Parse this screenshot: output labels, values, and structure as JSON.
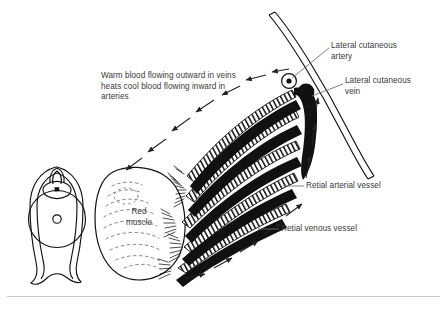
{
  "figure": {
    "annotation": "Warm blood flowing outward in veins heats cool blood flowing inward in arteries",
    "labels": {
      "lateral_cutaneous_artery": "Lateral cutaneous\nartery",
      "lateral_cutaneous_vein": "Lateral cutaneous\nvein",
      "retial_arterial_vessel": "Retial arterial vessel",
      "retial_venous_vessel": "Retial venous vessel",
      "red_muscle": "Red\nmuscle"
    },
    "colors": {
      "ink": "#000000",
      "text": "#3a3a3a",
      "background": "#ffffff",
      "rule": "#c9c9c9"
    },
    "parts": {
      "cross_section": "body-cross-section",
      "muscle_mass": "red-muscle-mass",
      "vessel_bundle": "retial-vessel-bundle",
      "vein_knob": "lateral-cutaneous-vein-knob",
      "artery_ring": "lateral-cutaneous-artery-ring",
      "trunk": "lateral-cutaneous-trunk"
    },
    "flow": {
      "outward_direction": "outward in veins (toward muscle, arrows point left/down-left)",
      "inward_direction": "inward in arteries (toward trunk, arrows point up-right)"
    }
  }
}
